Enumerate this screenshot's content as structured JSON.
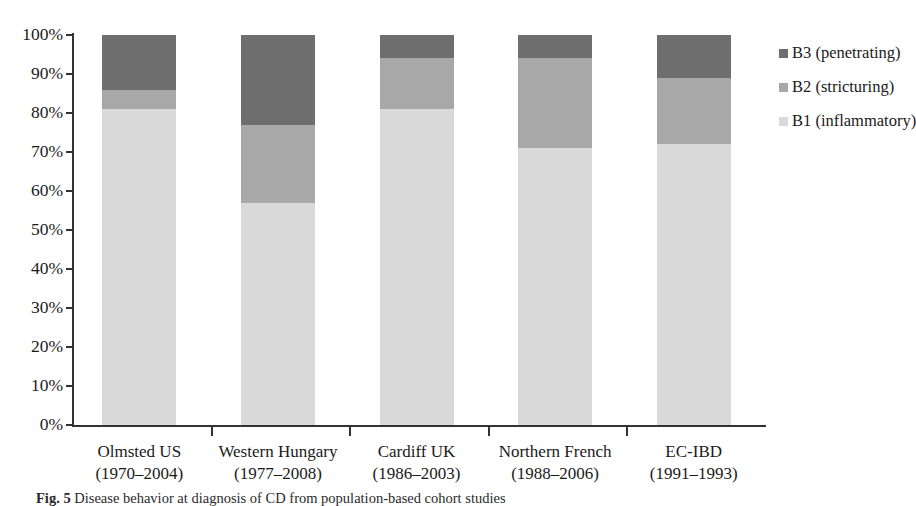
{
  "chart_data": {
    "type": "bar",
    "subtype": "100-percent-stacked-column",
    "title": "",
    "xlabel": "",
    "ylabel": "",
    "ylim": [
      0,
      100
    ],
    "yticks": [
      "0%",
      "10%",
      "20%",
      "30%",
      "40%",
      "50%",
      "60%",
      "70%",
      "80%",
      "90%",
      "100%"
    ],
    "grid": false,
    "legend_position": "right",
    "categories": [
      "Olmsted US (1970–2004)",
      "Western Hungary (1977–2008)",
      "Cardiff  UK (1986–2003)",
      "Northern French (1988–2006)",
      "EC-IBD (1991–1993)"
    ],
    "category_lines": [
      {
        "line1": "Olmsted US",
        "line2": "(1970–2004)"
      },
      {
        "line1": "Western Hungary",
        "line2": "(1977–2008)"
      },
      {
        "line1": "Cardiff  UK",
        "line2": "(1986–2003)"
      },
      {
        "line1": "Northern French",
        "line2": "(1988–2006)"
      },
      {
        "line1": "EC-IBD",
        "line2": "(1991–1993)"
      }
    ],
    "series": [
      {
        "name": "B1 (inflammatory)",
        "color": "#d9d9d9",
        "values": [
          81,
          57,
          81,
          71,
          72
        ]
      },
      {
        "name": "B2 (stricturing)",
        "color": "#a8a8a8",
        "values": [
          5,
          20,
          13,
          23,
          17
        ]
      },
      {
        "name": "B3 (penetrating)",
        "color": "#6e6e6e",
        "values": [
          14,
          23,
          6,
          6,
          11
        ]
      }
    ],
    "stack_order_bottom_to_top": [
      "B1 (inflammatory)",
      "B2 (stricturing)",
      "B3 (penetrating)"
    ]
  },
  "legend": {
    "items": [
      {
        "label": "B3 (penetrating)",
        "color": "#6e6e6e"
      },
      {
        "label": "B2 (stricturing)",
        "color": "#a8a8a8"
      },
      {
        "label": "B1 (inflammatory)",
        "color": "#d9d9d9"
      }
    ]
  },
  "caption": {
    "prefix": "Fig. 5",
    "text": "Disease behavior at diagnosis of CD from population-based cohort studies"
  }
}
